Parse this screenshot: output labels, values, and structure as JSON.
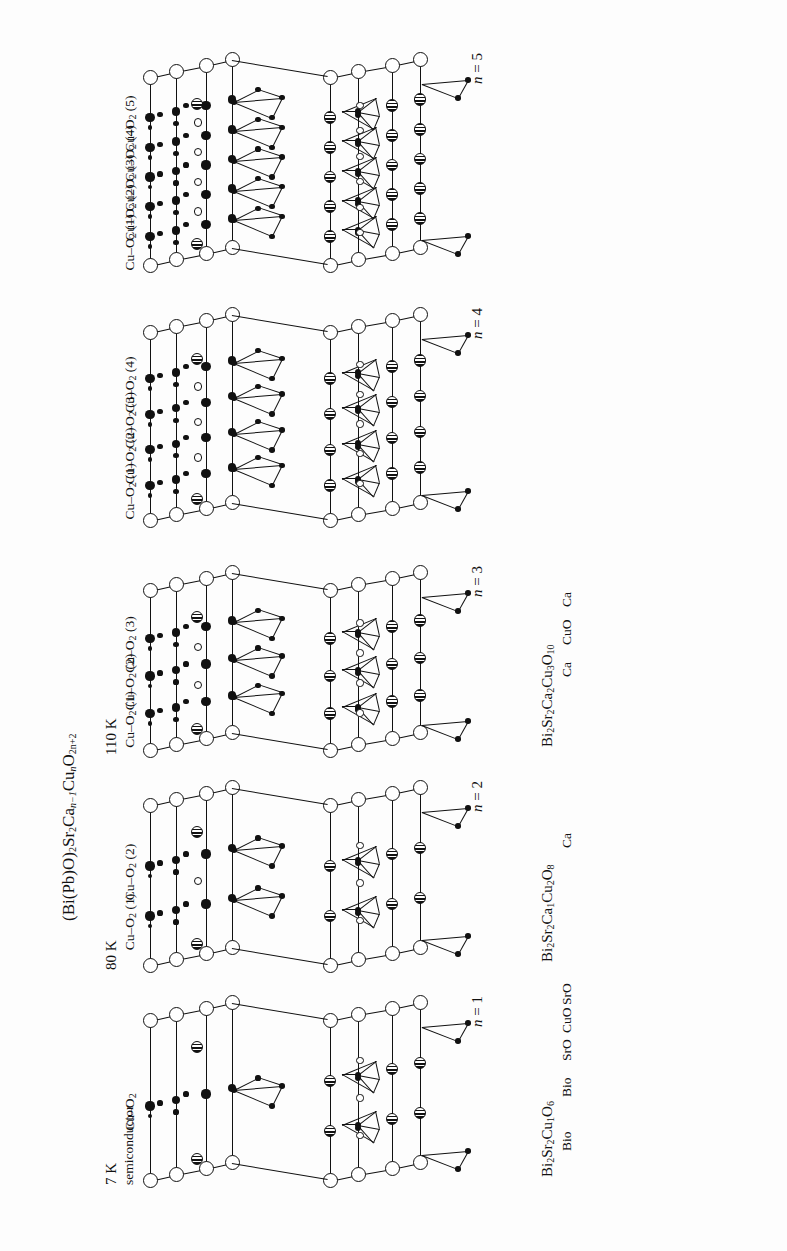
{
  "figure": {
    "title_formula": "(Bi(Pb)O)2 Sr2 Can-1 Cun O2n+2",
    "title_parts": {
      "p1": "(Bi(Pb)O)",
      "s1": "2",
      "p2": "Sr",
      "s2": "2",
      "p3": "Ca",
      "s3": "n−1",
      "p4": "Cu",
      "s4": "n",
      "p5": "O",
      "s5": "2n+2"
    },
    "orientation": "rotated-90-ccw",
    "background": "#fdfdfd",
    "ink_color": "#111111"
  },
  "panels": [
    {
      "id": "n1",
      "n_label_prefix": "n",
      "n_label_value": "= 1",
      "tc": "7 K",
      "tc_note": "semiconductor",
      "formula_plain": "Bi2Sr2Cu1O6",
      "formula_parts": [
        {
          "t": "Bi",
          "s": "2"
        },
        {
          "t": "Sr",
          "s": "2"
        },
        {
          "t": "Cu",
          "s": "1"
        },
        {
          "t": "O",
          "s": "6"
        }
      ],
      "plane_labels": [
        {
          "t": "Cu–O",
          "s": "2",
          "n": ""
        }
      ],
      "layer_labels": [
        "Bio",
        "Bio",
        "SrO",
        "CuO",
        "SrO"
      ],
      "cu_planes": 1
    },
    {
      "id": "n2",
      "n_label_prefix": "n",
      "n_label_value": "= 2",
      "tc": "80 K",
      "tc_note": "",
      "formula_plain": "Bi2Sr2Ca1Cu2O8",
      "formula_parts": [
        {
          "t": "Bi",
          "s": "2"
        },
        {
          "t": "Sr",
          "s": "2"
        },
        {
          "t": "Ca",
          "s": "1"
        },
        {
          "t": "Cu",
          "s": "2"
        },
        {
          "t": "O",
          "s": "8"
        }
      ],
      "plane_labels": [
        {
          "t": "Cu–O",
          "s": "2",
          "n": "(1)"
        },
        {
          "t": "Cu–O",
          "s": "2",
          "n": "(2)"
        }
      ],
      "layer_labels": [
        "Ca"
      ],
      "cu_planes": 2
    },
    {
      "id": "n3",
      "n_label_prefix": "n",
      "n_label_value": "= 3",
      "tc": "110 K",
      "tc_note": "",
      "formula_plain": "Bi2Sr2Ca2Cu3O10",
      "formula_parts": [
        {
          "t": "Bi",
          "s": "2"
        },
        {
          "t": "Sr",
          "s": "2"
        },
        {
          "t": "Ca",
          "s": "2"
        },
        {
          "t": "Cu",
          "s": "3"
        },
        {
          "t": "O",
          "s": "10"
        }
      ],
      "plane_labels": [
        {
          "t": "Cu–O",
          "s": "2",
          "n": "(1)"
        },
        {
          "t": "Cu–O",
          "s": "2",
          "n": "(2)"
        },
        {
          "t": "Cu–O",
          "s": "2",
          "n": "(3)"
        }
      ],
      "layer_labels": [
        "Ca",
        "CuO",
        "Ca"
      ],
      "cu_planes": 3
    },
    {
      "id": "n4",
      "n_label_prefix": "n",
      "n_label_value": "= 4",
      "tc": "",
      "tc_note": "",
      "formula_plain": "",
      "formula_parts": [],
      "plane_labels": [
        {
          "t": "Cu–O",
          "s": "2",
          "n": "(1)"
        },
        {
          "t": "Cu–O",
          "s": "2",
          "n": "(2)"
        },
        {
          "t": "Cu–O",
          "s": "2",
          "n": "(3)"
        },
        {
          "t": "Cu–O",
          "s": "2",
          "n": "(4)"
        }
      ],
      "layer_labels": [],
      "cu_planes": 4
    },
    {
      "id": "n5",
      "n_label_prefix": "n",
      "n_label_value": "= 5",
      "tc": "",
      "tc_note": "",
      "formula_plain": "",
      "formula_parts": [],
      "plane_labels": [
        {
          "t": "Cu–O",
          "s": "2",
          "n": "(1)"
        },
        {
          "t": "Cu–O",
          "s": "2",
          "n": "(2)"
        },
        {
          "t": "Cu–O",
          "s": "2",
          "n": "(3)"
        },
        {
          "t": "Cu–O",
          "s": "2",
          "n": "(4)"
        },
        {
          "t": "Cu–O",
          "s": "2",
          "n": "(5)"
        }
      ],
      "layer_labels": [],
      "cu_planes": 5
    }
  ],
  "legend_atom_types": [
    {
      "name": "large-open-circle",
      "meaning": "Bi/Sr large site"
    },
    {
      "name": "hatched-circle",
      "meaning": "Sr / Ca striped site"
    },
    {
      "name": "filled-small-circle",
      "meaning": "O"
    },
    {
      "name": "open-small-ring",
      "meaning": "Ca"
    },
    {
      "name": "pyramid-polyhedron",
      "meaning": "CuO5 pyramid"
    }
  ]
}
